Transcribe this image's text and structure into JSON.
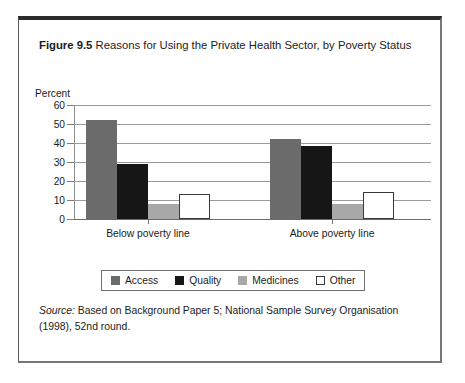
{
  "figure": {
    "label": "Figure 9.5",
    "caption": " Reasons for Using the Private Health Sector, by Poverty Status"
  },
  "source": {
    "label": "Source:",
    "text": " Based on Background Paper 5; National Sample Survey Organisation (1998), 52nd round."
  },
  "colors": {
    "access": "#6b6b6b",
    "quality": "#161616",
    "medicines": "#a8a8a8",
    "other": "#ffffff",
    "outline": "#3a3a3a",
    "gridline": "#9a9a9a",
    "text": "#1b1b1b"
  },
  "chart_data": {
    "type": "bar",
    "title": "Reasons for Using the Private Health Sector, by Poverty Status",
    "xlabel": "",
    "ylabel": "Percent",
    "ylim": [
      0,
      60
    ],
    "yticks": [
      0,
      10,
      20,
      30,
      40,
      50,
      60
    ],
    "ytick_labels": [
      "0",
      "10",
      "20",
      "30",
      "40",
      "50",
      "60"
    ],
    "grid": true,
    "legend_position": "bottom",
    "categories": [
      "Below poverty line",
      "Above poverty line"
    ],
    "series": [
      {
        "name": "Access",
        "values": [
          52,
          42
        ]
      },
      {
        "name": "Quality",
        "values": [
          29,
          38.5
        ]
      },
      {
        "name": "Medicines",
        "values": [
          8,
          8
        ]
      },
      {
        "name": "Other",
        "values": [
          13,
          14
        ]
      }
    ]
  }
}
